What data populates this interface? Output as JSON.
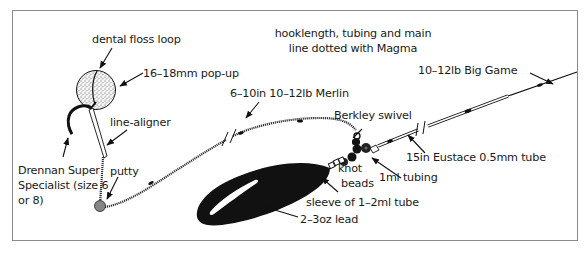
{
  "diagram": {
    "type": "carp rig illustration",
    "frame_color": "#8a8a8a",
    "ink_color": "#111111",
    "labels": {
      "dental_floss_loop": "dental floss loop",
      "popup": "16–18mm pop-up",
      "line_aligner": "line-aligner",
      "hook_line1": "Drennan Super",
      "hook_line2": "Specialist (size 6",
      "hook_line3": "or 8)",
      "putty": "putty",
      "magma_line1": "hooklength, tubing and main",
      "magma_line2": "line dotted with Magma",
      "merlin": "6–10in 10–12lb Merlin",
      "swivel": "Berkley swivel",
      "big_game": "10–12lb Big Game",
      "eustace_tube": "15in Eustace 0.5mm tube",
      "ml_tubing": "1ml tubing",
      "knot": "knot",
      "beads": "beads",
      "sleeve": "sleeve of 1–2ml tube",
      "lead": "2–3oz lead"
    }
  }
}
